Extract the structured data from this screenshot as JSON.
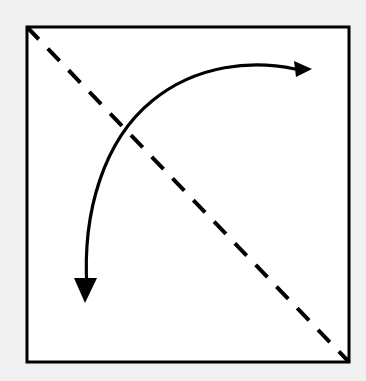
{
  "diagram": {
    "type": "origami-fold-instruction",
    "canvas": {
      "width": 366,
      "height": 381,
      "background_color": "#f0f0f0"
    },
    "sheet": {
      "label": "paper-square",
      "shape": "square",
      "fill_color": "#ffffff",
      "stroke_color": "#000000",
      "stroke_width": 3,
      "left": 27,
      "top": 27,
      "right": 349,
      "bottom": 362,
      "width": 322,
      "height": 335,
      "path": "M 27 27 L 349 27 L 349 362 L 27 362 Z"
    },
    "fold_line": {
      "label": "valley-fold-diagonal",
      "style": "dashed",
      "stroke_color": "#000000",
      "stroke_width": 4,
      "dash_length": 17,
      "gap_length": 13,
      "start": {
        "x": 27,
        "y": 27
      },
      "end": {
        "x": 349,
        "y": 362
      },
      "path": "M 27 27 L 349 362 "
    },
    "motion_arrow": {
      "label": "fold-rotation-arrow",
      "stroke_color": "#000000",
      "stroke_width": 3.2,
      "arc_path": "M 87 288 C 82 212 104 140 152 101 C 197 64 253 60 295 69",
      "start_point": {
        "x": 87,
        "y": 288
      },
      "end_point": {
        "x": 295,
        "y": 69
      },
      "heads": [
        {
          "label": "arrowhead-right",
          "direction": "right",
          "tip": {
            "x": 312,
            "y": 69
          },
          "path": "M 312 69 L 294 61 L 296 77 Z"
        },
        {
          "label": "arrowhead-down",
          "direction": "down",
          "tip": {
            "x": 85,
            "y": 303
          },
          "path": "M 85 303 L 74 278 L 97 278 Z"
        }
      ]
    }
  }
}
